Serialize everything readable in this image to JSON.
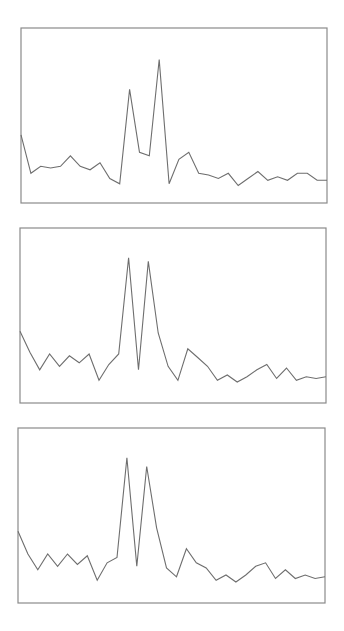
{
  "chart_data": [
    {
      "type": "line",
      "title": "",
      "xlabel": "",
      "ylabel": "",
      "grid": false,
      "legend": "none",
      "x": [
        0,
        1,
        2,
        3,
        4,
        5,
        6,
        7,
        8,
        9,
        10,
        11,
        12,
        13,
        14,
        15,
        16,
        17,
        18,
        19,
        20,
        21,
        22,
        23,
        24,
        25,
        26,
        27,
        28,
        29,
        30,
        31
      ],
      "xlim": [
        0,
        31
      ],
      "ylim": [
        0,
        1
      ],
      "series": [
        {
          "name": "panel-1",
          "color": "#6e6e6e",
          "values": [
            0.39,
            0.17,
            0.21,
            0.2,
            0.21,
            0.27,
            0.21,
            0.19,
            0.23,
            0.14,
            0.11,
            0.65,
            0.29,
            0.27,
            0.82,
            0.11,
            0.25,
            0.29,
            0.17,
            0.16,
            0.14,
            0.17,
            0.1,
            0.14,
            0.18,
            0.13,
            0.15,
            0.13,
            0.17,
            0.17,
            0.13,
            0.13
          ]
        }
      ]
    },
    {
      "type": "line",
      "title": "",
      "xlabel": "",
      "ylabel": "",
      "grid": false,
      "legend": "none",
      "x": [
        0,
        1,
        2,
        3,
        4,
        5,
        6,
        7,
        8,
        9,
        10,
        11,
        12,
        13,
        14,
        15,
        16,
        17,
        18,
        19,
        20,
        21,
        22,
        23,
        24,
        25,
        26,
        27,
        28,
        29,
        30,
        31
      ],
      "xlim": [
        0,
        31
      ],
      "ylim": [
        0,
        1
      ],
      "series": [
        {
          "name": "panel-2",
          "color": "#6e6e6e",
          "values": [
            0.41,
            0.29,
            0.19,
            0.28,
            0.21,
            0.27,
            0.23,
            0.28,
            0.13,
            0.22,
            0.28,
            0.83,
            0.19,
            0.81,
            0.4,
            0.21,
            0.13,
            0.31,
            0.26,
            0.21,
            0.13,
            0.16,
            0.12,
            0.15,
            0.19,
            0.22,
            0.14,
            0.2,
            0.13,
            0.15,
            0.14,
            0.15
          ]
        }
      ]
    },
    {
      "type": "line",
      "title": "",
      "xlabel": "",
      "ylabel": "",
      "grid": false,
      "legend": "none",
      "x": [
        0,
        1,
        2,
        3,
        4,
        5,
        6,
        7,
        8,
        9,
        10,
        11,
        12,
        13,
        14,
        15,
        16,
        17,
        18,
        19,
        20,
        21,
        22,
        23,
        24,
        25,
        26,
        27,
        28,
        29,
        30,
        31
      ],
      "xlim": [
        0,
        31
      ],
      "ylim": [
        0,
        1
      ],
      "series": [
        {
          "name": "panel-3",
          "color": "#6e6e6e",
          "values": [
            0.41,
            0.28,
            0.19,
            0.28,
            0.21,
            0.28,
            0.22,
            0.27,
            0.13,
            0.23,
            0.26,
            0.83,
            0.21,
            0.78,
            0.43,
            0.2,
            0.15,
            0.31,
            0.23,
            0.2,
            0.13,
            0.16,
            0.12,
            0.16,
            0.21,
            0.23,
            0.14,
            0.19,
            0.14,
            0.16,
            0.14,
            0.15
          ]
        }
      ]
    }
  ],
  "frame_color": "#8a8a8a"
}
